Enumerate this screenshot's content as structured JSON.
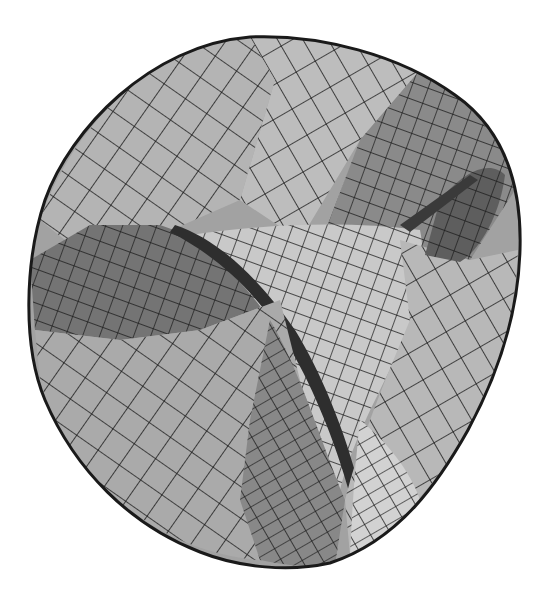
{
  "figure": {
    "rendering": "grayscale shaded mesh with black grid lines",
    "colors": {
      "background": "#ffffff",
      "outline": "#1a1a1a",
      "grid_line": "#1c1c1c",
      "face_light": "#c8c8c8",
      "face_mid": "#9d9d9d",
      "face_dark": "#6e6e6e",
      "face_darkest": "#3c3c3c",
      "highlight": "#dedede"
    }
  }
}
